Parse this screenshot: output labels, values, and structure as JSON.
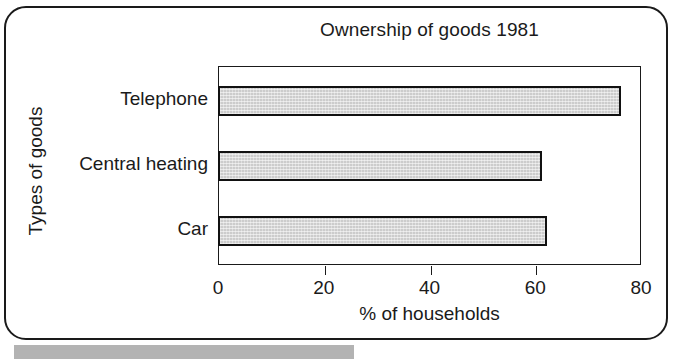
{
  "chart_data": {
    "type": "bar",
    "orientation": "horizontal",
    "title": "Ownership of goods 1981",
    "xlabel": "% of households",
    "ylabel": "Types of goods",
    "categories": [
      "Telephone",
      "Central heating",
      "Car"
    ],
    "values": [
      76,
      61,
      62
    ],
    "xlim": [
      0,
      80
    ],
    "xticks": [
      0,
      20,
      40,
      60,
      80
    ],
    "xtick_labels": [
      "0",
      "20",
      "40",
      "60",
      "80"
    ],
    "grid": false,
    "legend": false,
    "bar_fill_color": "#cccccc",
    "bar_edge_color": "#111111",
    "background_color": "#ffffff",
    "text_color": "#1a1a1a"
  },
  "figure": {
    "title": "Ownership of goods 1981",
    "xlabel": "% of households",
    "ylabel": "Types of goods",
    "bars": [
      {
        "label": "Telephone",
        "value": 76
      },
      {
        "label": "Central heating",
        "value": 61
      },
      {
        "label": "Car",
        "value": 62
      }
    ],
    "ticks": [
      {
        "label": "0",
        "value": 0
      },
      {
        "label": "20",
        "value": 20
      },
      {
        "label": "40",
        "value": 40
      },
      {
        "label": "60",
        "value": 60
      },
      {
        "label": "80",
        "value": 80
      }
    ]
  }
}
